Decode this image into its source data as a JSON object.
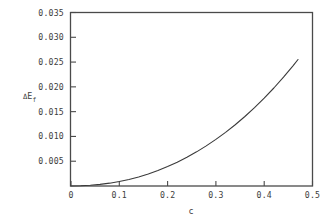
{
  "chart_data": {
    "type": "line",
    "title": "",
    "subtitle": "",
    "xlabel": "c",
    "ylabel": "ΔE_f",
    "ylabel_parts": {
      "delta": "Δ",
      "base": "E",
      "subscript": "f"
    },
    "xlim": [
      0,
      0.5
    ],
    "ylim": [
      0,
      0.035
    ],
    "xticks": [
      0,
      0.1,
      0.2,
      0.3,
      0.4,
      0.5
    ],
    "xtick_labels": [
      "0",
      "0.1",
      "0.2",
      "0.3",
      "0.4",
      "0.5"
    ],
    "yticks": [
      0.005,
      0.01,
      0.015,
      0.02,
      0.025,
      0.03,
      0.035
    ],
    "ytick_labels": [
      "0.005",
      "0.010",
      "0.015",
      "0.020",
      "0.025",
      "0.030",
      "0.035"
    ],
    "grid": false,
    "legend": null,
    "legend_position": "none",
    "axis_color": "#4a4a4a",
    "curve_color": "#3a3a3a",
    "background_color": "#ffffff",
    "series": [
      {
        "name": "ΔE_f vs c",
        "x": [
          0.0,
          0.02,
          0.04,
          0.06,
          0.08,
          0.1,
          0.12,
          0.14,
          0.16,
          0.18,
          0.2,
          0.22,
          0.24,
          0.26,
          0.28,
          0.3,
          0.32,
          0.34,
          0.36,
          0.38,
          0.4,
          0.42,
          0.44,
          0.46,
          0.47
        ],
        "y": [
          0.0,
          5e-05,
          0.00015,
          0.00032,
          0.00057,
          0.0009,
          0.00132,
          0.00183,
          0.00243,
          0.00313,
          0.00392,
          0.00481,
          0.0058,
          0.00689,
          0.00809,
          0.0094,
          0.01082,
          0.01236,
          0.01402,
          0.01581,
          0.01772,
          0.01977,
          0.02196,
          0.02429,
          0.02552
        ]
      }
    ]
  }
}
